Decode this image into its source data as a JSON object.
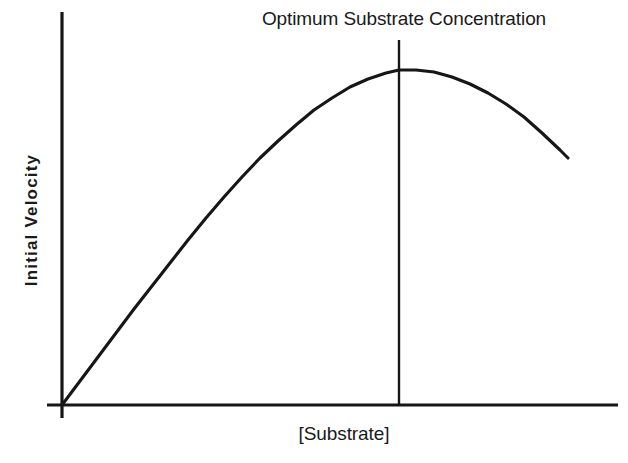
{
  "chart_data": {
    "type": "line",
    "title": "Optimum Substrate Concentration",
    "xlabel": "[Substrate]",
    "ylabel": "Initial Velocity",
    "grid": false,
    "legend": null,
    "xlim": [
      0,
      100
    ],
    "ylim": [
      0,
      100
    ],
    "axis_ticks": {
      "x": [],
      "y": []
    },
    "series": [
      {
        "name": "Reaction rate vs substrate concentration",
        "x": [
          0,
          5,
          10,
          16,
          22,
          28,
          33,
          40,
          49,
          57,
          66,
          74,
          80,
          86,
          92,
          100
        ],
        "y": [
          0,
          12,
          23,
          34,
          45,
          56,
          62,
          72,
          82,
          89,
          94,
          97,
          97,
          94,
          89,
          75
        ]
      }
    ],
    "annotations": [
      {
        "type": "vertical-line",
        "label": "Optimum Substrate Concentration",
        "x": 60,
        "note": "Marker line drawn at the substrate concentration giving peak initial velocity"
      }
    ],
    "curve_points_px": [
      [
        62,
        405
      ],
      [
        80,
        381
      ],
      [
        98,
        357
      ],
      [
        116,
        333
      ],
      [
        134,
        309
      ],
      [
        152,
        286
      ],
      [
        170,
        263
      ],
      [
        188,
        240
      ],
      [
        206,
        218
      ],
      [
        224,
        197
      ],
      [
        242,
        177
      ],
      [
        260,
        158
      ],
      [
        278,
        141
      ],
      [
        296,
        125
      ],
      [
        314,
        110
      ],
      [
        332,
        98
      ],
      [
        350,
        87
      ],
      [
        368,
        79
      ],
      [
        386,
        73
      ],
      [
        399,
        70
      ],
      [
        416,
        70
      ],
      [
        434,
        72
      ],
      [
        452,
        77
      ],
      [
        470,
        84
      ],
      [
        488,
        93
      ],
      [
        506,
        104
      ],
      [
        524,
        117
      ],
      [
        542,
        133
      ],
      [
        560,
        150
      ],
      [
        568,
        158
      ]
    ],
    "geometry_px": {
      "origin": [
        62,
        405
      ],
      "y_axis": {
        "x": 62,
        "y_top": 12,
        "y_bottom": 418
      },
      "x_axis": {
        "y": 405,
        "x_left": 47,
        "x_right": 618
      },
      "marker_line": {
        "x": 399,
        "y_top": 40,
        "y_bottom": 405
      },
      "stroke_color": "#161616",
      "background_color": "#ffffff"
    }
  },
  "colors": {
    "ink": "#161616",
    "background": "#ffffff",
    "text": "#1a1a1a"
  }
}
